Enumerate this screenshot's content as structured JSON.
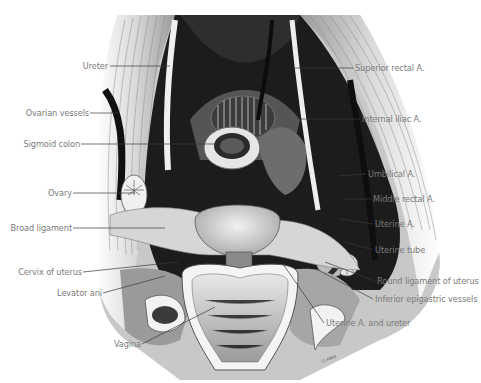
{
  "figure": {
    "type": "anatomical illustration",
    "signature": "CLARKE",
    "colors": {
      "background": "#ffffff",
      "label_text": "#7a7a7a",
      "leader_line": "#3a3a3a",
      "dark_tissue": "#1a1a1a"
    }
  },
  "labels": {
    "left": [
      {
        "text": "Ureter"
      },
      {
        "text": "Ovarian vessels"
      },
      {
        "text": "Sigmoid colon"
      },
      {
        "text": "Ovary"
      },
      {
        "text": "Broad ligament"
      },
      {
        "text": "Cervix of uterus"
      },
      {
        "text": "Levator ani"
      },
      {
        "text": "Vagina"
      }
    ],
    "right": [
      {
        "text": "Superior rectal A."
      },
      {
        "text": "Internal iliac A."
      },
      {
        "text": "Umbilical A."
      },
      {
        "text": "Middle rectal A."
      },
      {
        "text": "Uterine A."
      },
      {
        "text": "Uterine tube"
      },
      {
        "text": "Round ligament of uterus"
      },
      {
        "text": "Inferior epigastric vessels"
      },
      {
        "text": "Uterine A. and ureter"
      }
    ]
  }
}
